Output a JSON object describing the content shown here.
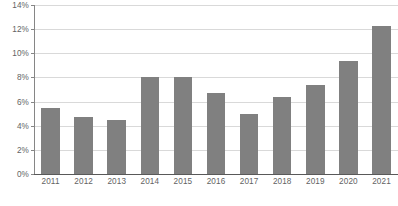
{
  "chart_data": {
    "type": "bar",
    "title": "",
    "subtitle": "",
    "xlabel": "",
    "ylabel": "",
    "categories": [
      "2011",
      "2012",
      "2013",
      "2014",
      "2015",
      "2016",
      "2017",
      "2018",
      "2019",
      "2020",
      "2021"
    ],
    "values": [
      5.5,
      4.7,
      4.5,
      8.0,
      8.0,
      6.7,
      5.0,
      6.4,
      7.4,
      9.4,
      12.3
    ],
    "value_suffix": "%",
    "ylim": [
      0,
      14
    ],
    "ytick_values": [
      0,
      2,
      4,
      6,
      8,
      10,
      12,
      14
    ],
    "ytick_labels": [
      "0%",
      "2%",
      "4%",
      "6%",
      "8%",
      "10%",
      "12%",
      "14%"
    ],
    "grid": true,
    "grid_axis": "y",
    "legend": null,
    "legend_position": "none",
    "series": [
      {
        "name": "",
        "color": "#808080",
        "values": [
          5.5,
          4.7,
          4.5,
          8.0,
          8.0,
          6.7,
          5.0,
          6.4,
          7.4,
          9.4,
          12.3
        ]
      }
    ]
  },
  "style": {
    "bar_color": "#808080",
    "grid_color": "#d9d9d9",
    "axis_color": "#595959",
    "tick_label_color": "#636363",
    "background": "#ffffff"
  }
}
